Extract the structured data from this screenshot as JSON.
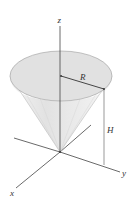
{
  "diagram": {
    "type": "3d-cone-in-axes",
    "axes": {
      "x_label": "x",
      "y_label": "y",
      "z_label": "z"
    },
    "dimensions": {
      "radius_label": "R",
      "height_label": "H"
    },
    "colors": {
      "cone_fill": "#e6e6e6",
      "cone_top": "#dcdcdc",
      "axis": "#444444",
      "outline": "#9a9a9a"
    }
  }
}
